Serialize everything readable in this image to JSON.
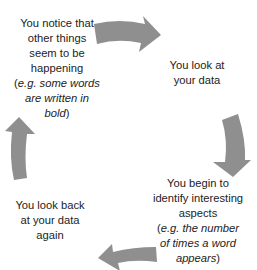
{
  "diagram": {
    "type": "cycle",
    "arrow_color": "#8f8f8f",
    "text_color": "#222222",
    "stages": [
      {
        "id": "notice",
        "lines": [
          "You notice that",
          "other things",
          "seem to be",
          "happening"
        ],
        "example_open": "(",
        "example_lines": [
          "e.g. some words",
          "are written in",
          "bold"
        ],
        "example_close": ")"
      },
      {
        "id": "look",
        "lines": [
          "You look at",
          "your data"
        ]
      },
      {
        "id": "identify",
        "lines": [
          "You begin to",
          "identify interesting",
          "aspects"
        ],
        "example_open": "(",
        "example_lines": [
          "e.g. the number",
          "of times a word",
          "appears"
        ],
        "example_close": ")"
      },
      {
        "id": "look-back",
        "lines": [
          "You look back",
          "at your data",
          "again"
        ]
      }
    ],
    "arrows": [
      {
        "from": "notice",
        "to": "look",
        "direction": "right",
        "icon": "curved-arrow-right-icon"
      },
      {
        "from": "look",
        "to": "identify",
        "direction": "down",
        "icon": "curved-arrow-down-icon"
      },
      {
        "from": "identify",
        "to": "look-back",
        "direction": "left",
        "icon": "curved-arrow-left-icon"
      },
      {
        "from": "look-back",
        "to": "notice",
        "direction": "up",
        "icon": "curved-arrow-up-icon"
      }
    ]
  }
}
